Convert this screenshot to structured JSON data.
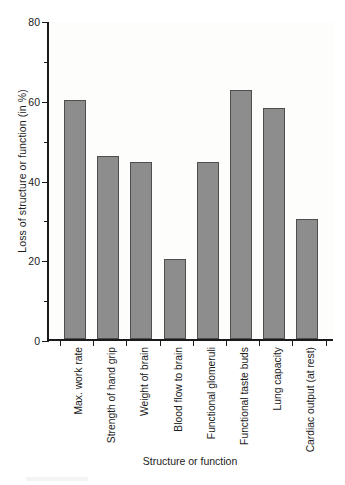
{
  "chart_data": {
    "type": "bar",
    "title": "",
    "subtitle": "",
    "xlabel": "Structure or function",
    "ylabel": "Loss of structure or function (in %)",
    "categories": [
      "Max. work rate",
      "Strength of hand grip",
      "Weight of brain",
      "Blood flow to brain",
      "Functional glomeruli",
      "Functional taste buds",
      "Lung capacity",
      "Cardiac output (at rest)"
    ],
    "values": [
      60,
      46,
      44.5,
      20,
      44.5,
      62.5,
      58,
      30
    ],
    "ylim": [
      0,
      80
    ],
    "xlim": [
      0,
      8
    ],
    "y_ticks_major": [
      0,
      20,
      40,
      60,
      80
    ],
    "y_ticks_minor": [
      10,
      30,
      50,
      70
    ],
    "y_tick_labels": [
      "0",
      "20",
      "40",
      "60",
      "80"
    ],
    "grid": false,
    "legend": null,
    "legend_position": "none",
    "bar_color": "#8d8d8d",
    "bar_border_color": "#4e4e4e",
    "axis_color": "#1a1a1a",
    "plot_background": "#fdfdfc",
    "figure_background": "#ffffff"
  },
  "axes": {
    "y_title": "Loss of structure or function (in %)",
    "x_title": "Structure or function"
  }
}
